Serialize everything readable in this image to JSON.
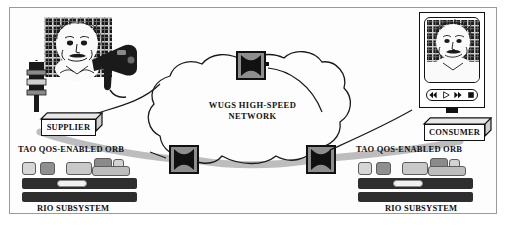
{
  "diagram": {
    "background": "#ffffff",
    "frame_color": "#9a9a9a"
  },
  "network": {
    "cloud_label_line1": "WUGS  HIGH-SPEED",
    "cloud_label_line2": "NETWORK",
    "switches": [
      {
        "id": "switch-top",
        "glyph": "X",
        "x": 236,
        "y": 51
      },
      {
        "id": "switch-bottom-left",
        "glyph": "X",
        "x": 169,
        "y": 145
      },
      {
        "id": "switch-bottom-right",
        "glyph": "X",
        "x": 306,
        "y": 145
      }
    ],
    "node_body_color": "#111111",
    "node_face_color": "#8e8e8e",
    "pipe_color": "#b4b4b4"
  },
  "supplier_side": {
    "endpoint_label": "SUPPLIER",
    "orb_label": "TAO QOS-ENABLED  ORB",
    "subsystem_label": "RIO  SUBSYSTEM",
    "camera_icon": "video-camera-icon",
    "portrait_icon": "einstein-portrait-icon"
  },
  "consumer_side": {
    "endpoint_label": "CONSUMER",
    "orb_label": "TAO QOS-ENABLED  ORB",
    "subsystem_label": "RIO  SUBSYSTEM",
    "player_icon": "video-player-icon",
    "portrait_icon": "einstein-portrait-icon",
    "controls": [
      {
        "name": "rewind-button",
        "glyph": "◀◀"
      },
      {
        "name": "play-button",
        "glyph": "▷"
      },
      {
        "name": "fast-forward-button",
        "glyph": "▶▶"
      },
      {
        "name": "stop-button",
        "glyph": "■"
      }
    ]
  },
  "palette": {
    "chip_light": "#d6d6d6",
    "chip_mid": "#a8a8a8",
    "chip_dark": "#7c7c7c",
    "bar_dark": "#2e2e2e",
    "bar_hole": "#f2f2f2",
    "ink": "#111111"
  }
}
